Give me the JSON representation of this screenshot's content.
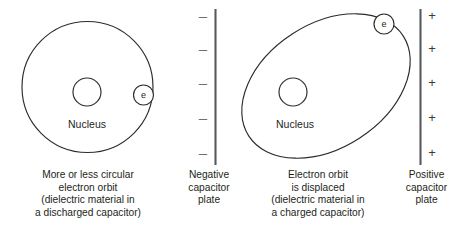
{
  "figure": {
    "stroke_color": "#2b2b2b",
    "plate_color": "#58595b",
    "background_color": "#ffffff"
  },
  "left_atom": {
    "orbit_shape": "circle",
    "nucleus_label": "Nucleus",
    "electron_label": "e"
  },
  "right_atom": {
    "orbit_shape": "ellipse-tilted",
    "nucleus_label": "Nucleus",
    "electron_label": "e"
  },
  "negative_plate": {
    "charge_glyph": "–",
    "charge_count": 5,
    "caption_lines": [
      "Negative",
      "capacitor",
      "plate"
    ]
  },
  "positive_plate": {
    "charge_glyph": "+",
    "charge_count": 5,
    "caption_lines": [
      "Positive",
      "capacitor",
      "plate"
    ]
  },
  "captions": {
    "discharged": [
      "More or less circular",
      "electron orbit",
      "(dielectric material in",
      "a discharged capacitor)"
    ],
    "charged": [
      "Electron orbit",
      "is displaced",
      "(dielectric material in",
      "a charged capacitor)"
    ]
  }
}
